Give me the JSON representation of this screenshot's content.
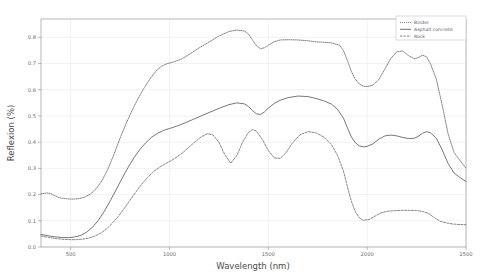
{
  "chart_data": {
    "type": "line",
    "title": "",
    "xlabel": "Wavelength (nm)",
    "ylabel": "Reflexion (%)",
    "xlim": [
      350,
      2500
    ],
    "ylim": [
      0.0,
      0.87
    ],
    "xticks": [
      500,
      1000,
      1500,
      2000,
      2500
    ],
    "xtick_labels": [
      "500",
      "1000",
      "1500",
      "2000",
      "2500"
    ],
    "yticks": [
      0.0,
      0.1,
      0.2,
      0.3,
      0.4,
      0.5,
      0.6,
      0.7,
      0.8
    ],
    "ytick_labels": [
      "0.0",
      "0.1",
      "0.2",
      "0.3",
      "0.4",
      "0.5",
      "0.6",
      "0.7",
      "0.8"
    ],
    "grid": true,
    "legend_position": "top-right",
    "series": [
      {
        "name": "Binder",
        "style": "dotted",
        "color": "#555555",
        "x": [
          350,
          380,
          400,
          420,
          440,
          460,
          480,
          500,
          520,
          545,
          570,
          600,
          630,
          660,
          690,
          720,
          750,
          780,
          810,
          840,
          870,
          900,
          930,
          960,
          990,
          1020,
          1060,
          1100,
          1150,
          1200,
          1250,
          1300,
          1340,
          1380,
          1400,
          1420,
          1440,
          1460,
          1480,
          1500,
          1530,
          1560,
          1600,
          1650,
          1700,
          1740,
          1780,
          1820,
          1860,
          1880,
          1900,
          1920,
          1940,
          1960,
          1980,
          2000,
          2030,
          2060,
          2090,
          2120,
          2150,
          2180,
          2210,
          2240,
          2260,
          2280,
          2300,
          2320,
          2350,
          2380,
          2410,
          2440,
          2470,
          2500
        ],
        "y": [
          0.203,
          0.206,
          0.204,
          0.196,
          0.189,
          0.186,
          0.184,
          0.183,
          0.183,
          0.185,
          0.19,
          0.202,
          0.223,
          0.255,
          0.3,
          0.355,
          0.415,
          0.47,
          0.52,
          0.565,
          0.605,
          0.64,
          0.67,
          0.69,
          0.7,
          0.706,
          0.717,
          0.735,
          0.76,
          0.782,
          0.805,
          0.822,
          0.828,
          0.824,
          0.812,
          0.79,
          0.768,
          0.757,
          0.76,
          0.77,
          0.783,
          0.79,
          0.791,
          0.79,
          0.787,
          0.783,
          0.781,
          0.779,
          0.77,
          0.75,
          0.712,
          0.67,
          0.64,
          0.622,
          0.614,
          0.612,
          0.618,
          0.64,
          0.68,
          0.72,
          0.745,
          0.748,
          0.73,
          0.718,
          0.723,
          0.732,
          0.726,
          0.7,
          0.64,
          0.54,
          0.43,
          0.36,
          0.33,
          0.3
        ]
      },
      {
        "name": "Asphalt concrete",
        "style": "solid",
        "color": "#4a4a4a",
        "x": [
          350,
          380,
          400,
          430,
          460,
          490,
          520,
          550,
          580,
          610,
          640,
          670,
          700,
          730,
          760,
          790,
          820,
          850,
          880,
          910,
          940,
          970,
          1000,
          1040,
          1080,
          1120,
          1160,
          1200,
          1250,
          1300,
          1340,
          1380,
          1400,
          1420,
          1440,
          1460,
          1480,
          1500,
          1530,
          1560,
          1600,
          1650,
          1700,
          1740,
          1780,
          1820,
          1850,
          1880,
          1900,
          1920,
          1940,
          1960,
          1980,
          2000,
          2030,
          2060,
          2090,
          2120,
          2150,
          2180,
          2210,
          2240,
          2260,
          2280,
          2300,
          2320,
          2350,
          2380,
          2410,
          2440,
          2470,
          2500
        ],
        "y": [
          0.048,
          0.044,
          0.041,
          0.038,
          0.036,
          0.036,
          0.038,
          0.044,
          0.056,
          0.075,
          0.102,
          0.136,
          0.176,
          0.218,
          0.262,
          0.303,
          0.34,
          0.372,
          0.398,
          0.419,
          0.434,
          0.445,
          0.452,
          0.462,
          0.474,
          0.487,
          0.5,
          0.513,
          0.529,
          0.543,
          0.55,
          0.546,
          0.536,
          0.52,
          0.508,
          0.506,
          0.515,
          0.53,
          0.548,
          0.56,
          0.57,
          0.576,
          0.574,
          0.567,
          0.558,
          0.545,
          0.525,
          0.492,
          0.455,
          0.42,
          0.398,
          0.386,
          0.382,
          0.384,
          0.394,
          0.412,
          0.424,
          0.427,
          0.424,
          0.418,
          0.414,
          0.415,
          0.423,
          0.434,
          0.44,
          0.436,
          0.415,
          0.37,
          0.318,
          0.282,
          0.265,
          0.25
        ]
      },
      {
        "name": "Rock",
        "style": "dashed",
        "color": "#606060",
        "x": [
          350,
          380,
          410,
          440,
          470,
          500,
          530,
          560,
          590,
          620,
          650,
          680,
          710,
          740,
          770,
          800,
          830,
          860,
          890,
          920,
          950,
          980,
          1010,
          1040,
          1070,
          1100,
          1130,
          1160,
          1190,
          1220,
          1250,
          1280,
          1310,
          1340,
          1370,
          1400,
          1420,
          1440,
          1470,
          1500,
          1530,
          1560,
          1590,
          1620,
          1660,
          1700,
          1740,
          1780,
          1820,
          1850,
          1880,
          1900,
          1920,
          1940,
          1960,
          1980,
          2010,
          2040,
          2070,
          2100,
          2140,
          2180,
          2220,
          2250,
          2280,
          2310,
          2340,
          2370,
          2400,
          2430,
          2460,
          2500
        ],
        "y": [
          0.042,
          0.038,
          0.034,
          0.031,
          0.029,
          0.028,
          0.028,
          0.03,
          0.034,
          0.041,
          0.052,
          0.068,
          0.09,
          0.116,
          0.146,
          0.178,
          0.21,
          0.24,
          0.266,
          0.288,
          0.305,
          0.318,
          0.33,
          0.345,
          0.362,
          0.382,
          0.402,
          0.42,
          0.432,
          0.428,
          0.4,
          0.352,
          0.32,
          0.348,
          0.4,
          0.438,
          0.448,
          0.442,
          0.41,
          0.368,
          0.34,
          0.338,
          0.36,
          0.395,
          0.428,
          0.44,
          0.436,
          0.42,
          0.39,
          0.35,
          0.29,
          0.23,
          0.175,
          0.135,
          0.112,
          0.102,
          0.105,
          0.118,
          0.13,
          0.136,
          0.139,
          0.14,
          0.14,
          0.139,
          0.136,
          0.128,
          0.112,
          0.098,
          0.092,
          0.088,
          0.086,
          0.085
        ]
      }
    ]
  }
}
